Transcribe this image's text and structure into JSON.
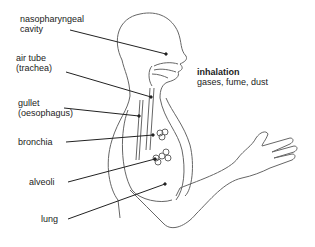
{
  "diagram": {
    "labels": {
      "nasopharyngeal": {
        "line1": "nasopharyngeal",
        "line2": "cavity"
      },
      "trachea": {
        "line1": "air tube",
        "line2": "(trachea)"
      },
      "gullet": {
        "line1": "gullet",
        "line2": "(oesophagus)"
      },
      "bronchia": "bronchia",
      "alveoli": "alveoli",
      "lung": "lung"
    },
    "annotation": {
      "heading": "inhalation",
      "subtext": "gases, fume, dust"
    },
    "colors": {
      "line": "#555555",
      "leader": "#222222",
      "text": "#222222"
    }
  }
}
